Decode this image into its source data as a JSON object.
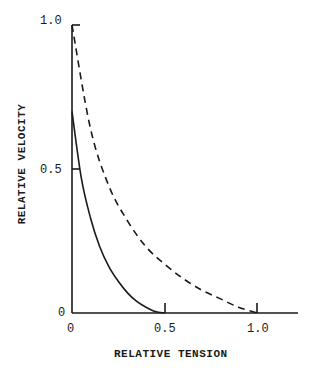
{
  "chart_data": {
    "type": "line",
    "title": "",
    "xlabel": "RELATIVE TENSION",
    "ylabel": "RELATIVE VELOCITY",
    "xlim": [
      0,
      1.2
    ],
    "ylim": [
      0,
      1.0
    ],
    "grid": false,
    "legend": null,
    "x_ticks": [
      "0",
      "0.5",
      "1.0"
    ],
    "y_ticks": [
      "0",
      "0.5",
      "1.0"
    ],
    "series": [
      {
        "name": "solid curve",
        "style": "solid",
        "x": [
          0,
          0.05,
          0.1,
          0.15,
          0.2,
          0.25,
          0.3,
          0.35,
          0.4,
          0.45,
          0.5
        ],
        "y": [
          0.7,
          0.47,
          0.33,
          0.23,
          0.16,
          0.11,
          0.07,
          0.04,
          0.02,
          0.005,
          0
        ]
      },
      {
        "name": "dashed curve",
        "style": "dashed",
        "x": [
          0,
          0.1,
          0.2,
          0.3,
          0.4,
          0.5,
          0.6,
          0.7,
          0.8,
          0.9,
          1.0
        ],
        "y": [
          1.0,
          0.64,
          0.44,
          0.32,
          0.23,
          0.17,
          0.12,
          0.08,
          0.05,
          0.02,
          0
        ]
      }
    ]
  },
  "labels": {
    "y_tick_1": "1.0",
    "y_tick_05": "0.5",
    "y_tick_0": "0",
    "x_tick_0": "0",
    "x_tick_05": "0.5",
    "x_tick_1": "1.0",
    "xlabel": "RELATIVE TENSION",
    "ylabel": "RELATIVE VELOCITY"
  }
}
